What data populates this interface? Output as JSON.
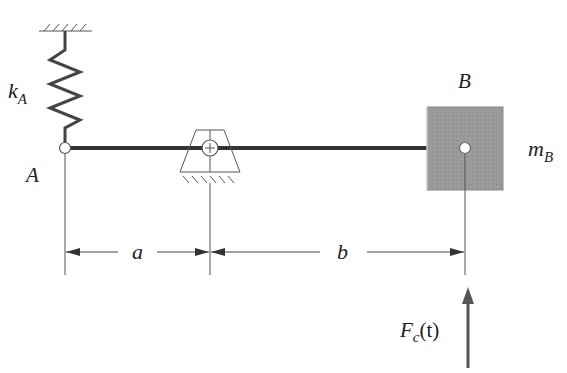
{
  "diagram": {
    "type": "mechanical-vibration-system",
    "labels": {
      "spring": "k",
      "spring_sub": "A",
      "point_a": "A",
      "point_b": "B",
      "mass": "m",
      "mass_sub": "B",
      "dim_a": "a",
      "dim_b": "b",
      "force": "F",
      "force_sub": "c",
      "force_arg": "(t)"
    },
    "colors": {
      "bar": "#333333",
      "mass_fill": "#9a9a9a",
      "line": "#444444",
      "background": "#ffffff"
    },
    "components": [
      "fixed ceiling support",
      "spring kA",
      "pin joint A",
      "rigid bar",
      "pivot support",
      "mass mB at B",
      "dimension a",
      "dimension b",
      "applied force Fc(t)"
    ]
  }
}
